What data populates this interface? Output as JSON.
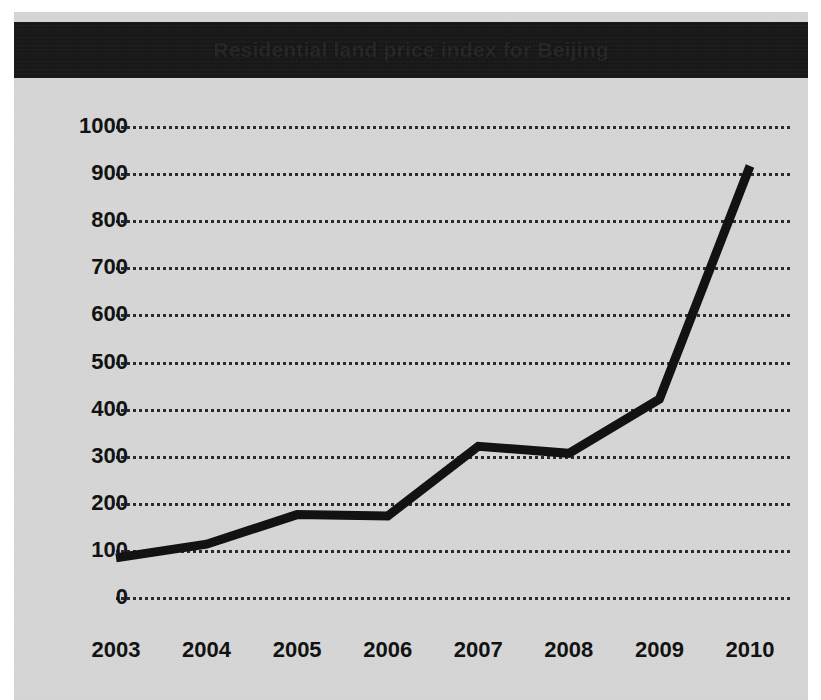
{
  "chart_data": {
    "type": "line",
    "title": "Residential land price index for Beijing",
    "xlabel": "",
    "ylabel": "",
    "x": [
      2003,
      2004,
      2005,
      2006,
      2007,
      2008,
      2009,
      2010
    ],
    "categories": [
      "2003",
      "2004",
      "2005",
      "2006",
      "2007",
      "2008",
      "2009",
      "2010"
    ],
    "values": [
      83,
      112,
      175,
      172,
      320,
      305,
      420,
      915
    ],
    "series": [
      {
        "name": "Residential land price index",
        "values": [
          83,
          112,
          175,
          172,
          320,
          305,
          420,
          915
        ]
      }
    ],
    "ylim": [
      0,
      1000
    ],
    "yticks": [
      0,
      100,
      200,
      300,
      400,
      500,
      600,
      700,
      800,
      900,
      1000
    ],
    "ytick_labels": [
      "0",
      "100",
      "200",
      "300",
      "400",
      "500",
      "600",
      "700",
      "800",
      "900",
      "1000"
    ],
    "xlim": [
      2003,
      2010
    ],
    "grid": "horizontal-dotted",
    "legend": "none",
    "line_color": "#111111",
    "plot_background": "#d6d6d6",
    "title_banner_color": "#161616"
  },
  "colors": {
    "page_background": "#ffffff",
    "card_background": "#d6d6d6",
    "banner": "#161616",
    "ink": "#111111"
  }
}
